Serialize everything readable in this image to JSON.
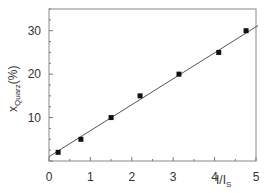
{
  "chart_data": {
    "type": "scatter",
    "title": "",
    "xlabel": "I/I_S",
    "xlabel_main": "I/I",
    "xlabel_sub": "S",
    "ylabel": "x_Quarz(%)",
    "ylabel_main": "x",
    "ylabel_sub": "Quarz",
    "ylabel_suffix": "(%)",
    "xlim": [
      0,
      5
    ],
    "ylim": [
      0,
      35
    ],
    "xticks": [
      0,
      1,
      2,
      3,
      4,
      5
    ],
    "xtick_labels": [
      "0",
      "1",
      "2",
      "3",
      "4",
      "5"
    ],
    "yticks": [
      10,
      20,
      30
    ],
    "ytick_labels": [
      "10",
      "20",
      "30"
    ],
    "grid": false,
    "legend": null,
    "series": [
      {
        "name": "data",
        "marker": "square",
        "color": "#111111",
        "x": [
          0.22,
          0.77,
          1.5,
          2.2,
          3.14,
          4.1,
          4.76
        ],
        "y": [
          2,
          5,
          10,
          15,
          20,
          25,
          30
        ]
      },
      {
        "name": "linear fit",
        "type": "line",
        "color": "#555555",
        "x": [
          0,
          5.05
        ],
        "y": [
          1.0,
          31.2
        ]
      }
    ]
  }
}
